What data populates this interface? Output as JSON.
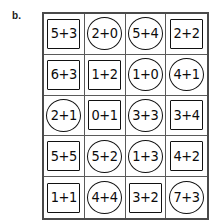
{
  "figure": {
    "label": "b.",
    "type": "math-worksheet-grid",
    "rows": 5,
    "columns": 4,
    "shape_types": [
      "square",
      "circle"
    ],
    "colors": {
      "background": "#ffffff",
      "grid_line": "#5a5a5a",
      "outer_border": "#4a4a4a",
      "shape_outline": "#111111",
      "text": "#0b0b0b"
    }
  },
  "grid": {
    "cells": [
      {
        "expression": "5+3",
        "shape": "square",
        "row": 1,
        "col": 1
      },
      {
        "expression": "2+0",
        "shape": "circle",
        "row": 1,
        "col": 2
      },
      {
        "expression": "5+4",
        "shape": "circle",
        "row": 1,
        "col": 3
      },
      {
        "expression": "2+2",
        "shape": "square",
        "row": 1,
        "col": 4
      },
      {
        "expression": "6+3",
        "shape": "square",
        "row": 2,
        "col": 1
      },
      {
        "expression": "1+2",
        "shape": "square",
        "row": 2,
        "col": 2
      },
      {
        "expression": "1+0",
        "shape": "circle",
        "row": 2,
        "col": 3
      },
      {
        "expression": "4+1",
        "shape": "circle",
        "row": 2,
        "col": 4
      },
      {
        "expression": "2+1",
        "shape": "circle",
        "row": 3,
        "col": 1
      },
      {
        "expression": "0+1",
        "shape": "square",
        "row": 3,
        "col": 2
      },
      {
        "expression": "3+3",
        "shape": "circle",
        "row": 3,
        "col": 3
      },
      {
        "expression": "3+4",
        "shape": "square",
        "row": 3,
        "col": 4
      },
      {
        "expression": "5+5",
        "shape": "square",
        "row": 4,
        "col": 1
      },
      {
        "expression": "5+2",
        "shape": "circle",
        "row": 4,
        "col": 2
      },
      {
        "expression": "1+3",
        "shape": "circle",
        "row": 4,
        "col": 3
      },
      {
        "expression": "4+2",
        "shape": "square",
        "row": 4,
        "col": 4
      },
      {
        "expression": "1+1",
        "shape": "square",
        "row": 5,
        "col": 1
      },
      {
        "expression": "4+4",
        "shape": "circle",
        "row": 5,
        "col": 2
      },
      {
        "expression": "3+2",
        "shape": "square",
        "row": 5,
        "col": 3
      },
      {
        "expression": "7+3",
        "shape": "circle",
        "row": 5,
        "col": 4
      }
    ]
  }
}
